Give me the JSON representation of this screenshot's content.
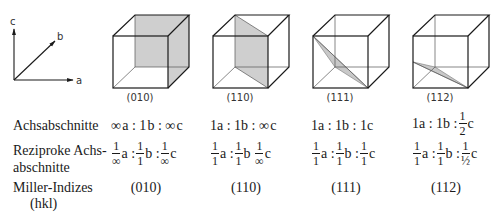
{
  "axes": {
    "a": "a",
    "b": "b",
    "c": "c"
  },
  "cubes": [
    {
      "label": "(010)"
    },
    {
      "label": "(110)"
    },
    {
      "label": "(111)"
    },
    {
      "label": "(112)"
    }
  ],
  "rows": {
    "intercepts": {
      "label": "Achsabschnitte",
      "values": [
        {
          "a": "∞",
          "b": "1",
          "c": "∞"
        },
        {
          "a": "1",
          "b": "1",
          "c": "∞"
        },
        {
          "a": "1",
          "b": "1",
          "c": "1"
        },
        {
          "a": "1",
          "b": "1",
          "c_num": "1",
          "c_den": "2"
        }
      ]
    },
    "reciprocals": {
      "label_line1": "Reziproke Achs-",
      "label_line2": "abschnitte",
      "values": [
        {
          "a_den": "∞",
          "b_den": "1",
          "c_den": "∞"
        },
        {
          "a_den": "1",
          "b_den": "1",
          "c_den": "∞"
        },
        {
          "a_den": "1",
          "b_den": "1",
          "c_den": "1"
        },
        {
          "a_den": "1",
          "b_den": "1",
          "c_den": "½"
        }
      ]
    },
    "miller": {
      "label_line1": "Miller-Indizes",
      "label_line2": "(hkl)",
      "values": [
        "(010)",
        "(110)",
        "(111)",
        "(112)"
      ]
    }
  },
  "symbols": {
    "one": "1",
    "colon": ":",
    "a": "a",
    "b": "b",
    "c": "c"
  },
  "colors": {
    "line": "#1a1a1a",
    "plane_fill": "#c8c8c8",
    "hidden_line": "#555555"
  }
}
